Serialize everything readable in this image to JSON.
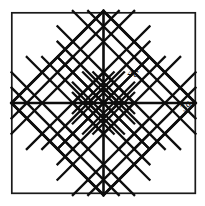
{
  "figure": {
    "background_color": "#ffffff",
    "stroke_color": "#101010",
    "frame": {
      "name": "outer-square-frame",
      "x": 11,
      "y": 12,
      "width": 185,
      "height": 182,
      "stroke_width": 1.6
    },
    "inscribed_diamond": {
      "name": "inscribed-square-rotated",
      "center_x": 103.5,
      "center_y": 103,
      "half_diagonal": 92,
      "stroke_width": 2.6
    },
    "quadrants": [
      {
        "name": "top-left-plain-diamond",
        "fill": "none",
        "label": ""
      },
      {
        "name": "top-right-plain-diamond",
        "fill": "none",
        "label": "4c"
      },
      {
        "name": "bottom-left-plain-diamond",
        "fill": "none",
        "label": ""
      },
      {
        "name": "bottom-right-plain-diamond",
        "fill": "none",
        "label": ""
      }
    ],
    "subdivided_clusters": [
      {
        "name": "cluster-center",
        "grid": 3,
        "cx": 103.5,
        "cy": 103
      },
      {
        "name": "cluster-top",
        "grid": 3,
        "cx": 103.5,
        "cy": 57
      },
      {
        "name": "cluster-bottom",
        "grid": 3,
        "cx": 103.5,
        "cy": 149
      },
      {
        "name": "cluster-left",
        "grid": 3,
        "cx": 57.5,
        "cy": 103
      },
      {
        "name": "cluster-right",
        "grid": 3,
        "cx": 149.5,
        "cy": 103
      }
    ],
    "labels": [
      {
        "name": "label-4c",
        "text": "4c",
        "x": 133,
        "y": 77,
        "font_size": 11,
        "rotation": 0
      },
      {
        "name": "label-3a",
        "text": "3a",
        "x": 188,
        "y": 108,
        "font_size": 10,
        "rotation": -45
      }
    ]
  }
}
